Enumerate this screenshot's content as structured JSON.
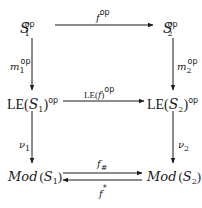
{
  "diagram": {
    "type": "commutative-diagram",
    "nodes": {
      "top_left": {
        "base": "S",
        "sub": "1",
        "sup": "op"
      },
      "top_right": {
        "base": "S",
        "sub": "2",
        "sup": "op"
      },
      "mid_left": {
        "prefix": "LE(",
        "base": "S",
        "sub": "1",
        "suffix": ")",
        "sup": "op"
      },
      "mid_right": {
        "prefix": "LE(",
        "base": "S",
        "sub": "2",
        "suffix": ")",
        "sup": "op"
      },
      "bot_left": {
        "prefix": "Mod",
        "open": "(",
        "base": "S",
        "sub": "1",
        "close": ")"
      },
      "bot_right": {
        "prefix": "Mod",
        "open": "(",
        "base": "S",
        "sub": "2",
        "close": ")"
      }
    },
    "arrows": {
      "top": {
        "from": "top_left",
        "to": "top_right",
        "label_base": "f",
        "label_sup": "op"
      },
      "left_upper": {
        "from": "top_left",
        "to": "mid_left",
        "label_base": "m",
        "label_sub": "1",
        "label_sup": "op"
      },
      "right_upper": {
        "from": "top_right",
        "to": "mid_right",
        "label_base": "m",
        "label_sub": "2",
        "label_sup": "op"
      },
      "middle": {
        "from": "mid_left",
        "to": "mid_right",
        "label_prefix": "LE(",
        "label_base": "f",
        "label_suffix": ")",
        "label_sup": "op"
      },
      "left_lower": {
        "from": "mid_left",
        "to": "bot_left",
        "label_base": "ν",
        "label_sub": "1"
      },
      "right_lower": {
        "from": "mid_right",
        "to": "bot_right",
        "label_base": "ν",
        "label_sub": "2"
      },
      "bottom_forward": {
        "from": "bot_left",
        "to": "bot_right",
        "label_base": "f",
        "label_sub": "#"
      },
      "bottom_backward": {
        "from": "bot_right",
        "to": "bot_left",
        "label_base": "f",
        "label_sup": "*"
      }
    },
    "line_color": "#1a1a1a"
  }
}
